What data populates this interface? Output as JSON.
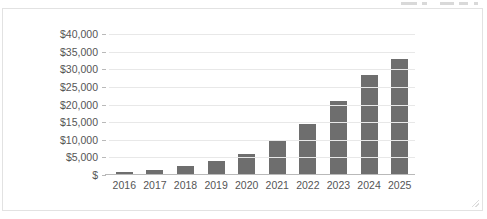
{
  "toolbar": {
    "visible_fragment": true
  },
  "chart_data": {
    "type": "bar",
    "title": "",
    "subtitle": "",
    "xlabel": "",
    "ylabel": "",
    "categories": [
      "2016",
      "2017",
      "2018",
      "2019",
      "2020",
      "2021",
      "2022",
      "2023",
      "2024",
      "2025"
    ],
    "values": [
      600,
      1200,
      2300,
      3700,
      5800,
      9500,
      14300,
      20600,
      28200,
      32500
    ],
    "series": [
      {
        "name": "",
        "values": [
          600,
          1200,
          2300,
          3700,
          5800,
          9500,
          14300,
          20600,
          28200,
          32500
        ]
      }
    ],
    "ylim": [
      0,
      40000
    ],
    "ytick_values": [
      0,
      5000,
      10000,
      15000,
      20000,
      25000,
      30000,
      35000,
      40000
    ],
    "ytick_labels": [
      "$",
      "$5,000",
      "$10,000",
      "$15,000",
      "$20,000",
      "$25,000",
      "$30,000",
      "$35,000",
      "$40,000"
    ],
    "grid": true,
    "legend": false,
    "legend_position": "none",
    "bar_color": "#6e6e6e",
    "gridline_color": "#e8e8e8",
    "axis_color": "#b9b9b9",
    "label_color": "#555555",
    "plot_background": "#ffffff",
    "frame_border_color": "#e2e2e2"
  }
}
